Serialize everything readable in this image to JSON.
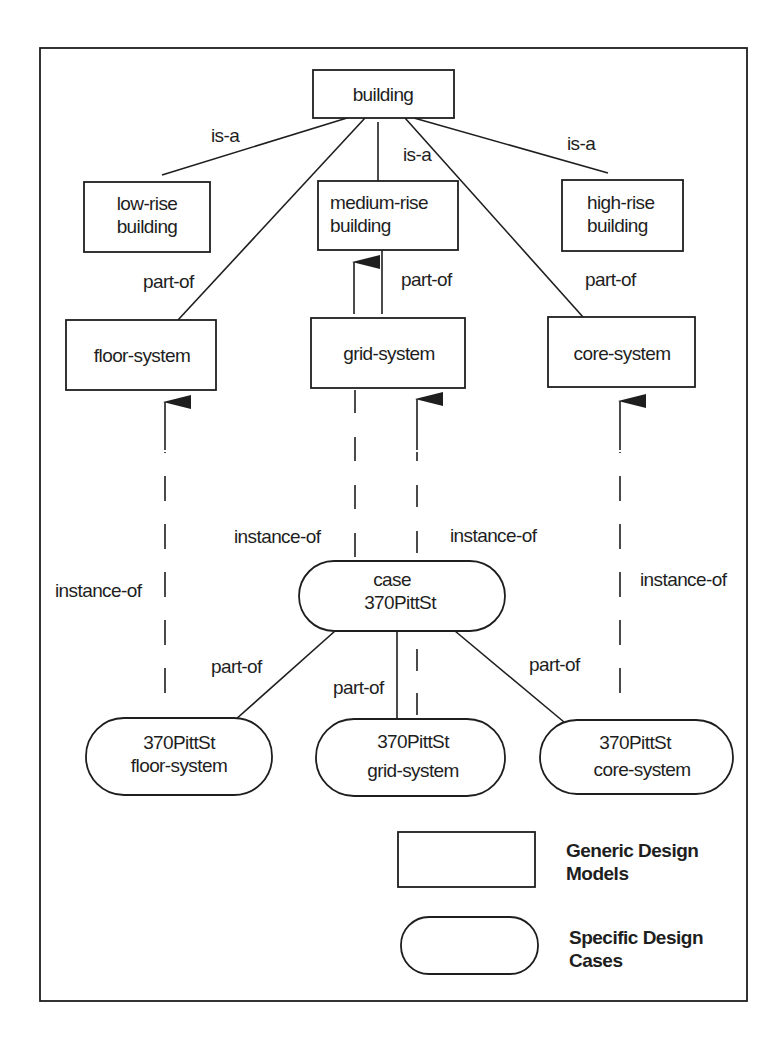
{
  "diagram": {
    "generic_models": {
      "building": "building",
      "low_rise": [
        "low-rise",
        "building"
      ],
      "medium_rise": [
        "medium-rise",
        "building"
      ],
      "high_rise": [
        "high-rise",
        "building"
      ],
      "floor_system": "floor-system",
      "grid_system": "grid-system",
      "core_system": "core-system"
    },
    "specific_cases": {
      "case": [
        "case",
        "370PittSt"
      ],
      "floor_case": [
        "370PittSt",
        "floor-system"
      ],
      "grid_case": [
        "370PittSt",
        "grid-system"
      ],
      "core_case": [
        "370PittSt",
        "core-system"
      ]
    },
    "edge_labels": {
      "isa_low": "is-a",
      "isa_medium": "is-a",
      "isa_high": "is-a",
      "partof_floor": "part-of",
      "partof_grid": "part-of",
      "partof_core": "part-of",
      "instanceof_floor": "instance-of",
      "instanceof_case": "instance-of",
      "instanceof_grid": "instance-of",
      "instanceof_core": "instance-of",
      "case_partof_floor": "part-of",
      "case_partof_grid": "part-of",
      "case_partof_core": "part-of"
    },
    "legend": {
      "generic_label": [
        "Generic Design",
        "Models"
      ],
      "specific_label": [
        "Specific Design",
        "Cases"
      ]
    },
    "colors": {
      "stroke": "#1e1e1e",
      "background": "#ffffff"
    }
  }
}
